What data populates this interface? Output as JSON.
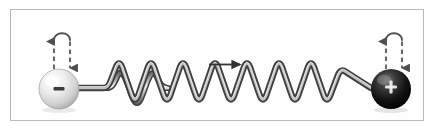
{
  "figure": {
    "title": "Oscillating dipole: two opposite charges joined by a spring",
    "background_color": "#ffffff",
    "frame": {
      "border_color": "#b9b9b9",
      "fill_color": "#fefefe",
      "x": 10,
      "y": 9,
      "width": 414,
      "height": 112
    },
    "objects": {
      "left_charge": {
        "name": "negative-charge-sphere",
        "sign_label": "−",
        "sign_color": "#3a3a3a",
        "fill_light": "#ffffff",
        "fill_mid": "#e2e2e2",
        "fill_dark": "#a9a9a9",
        "center_x": 59,
        "center_y": 89,
        "radius": 20
      },
      "right_charge": {
        "name": "positive-charge-sphere",
        "sign_label": "+",
        "sign_color": "#f2f2f2",
        "fill_light": "#6e6e6e",
        "fill_mid": "#1c1c1c",
        "fill_dark": "#000000",
        "center_x": 391,
        "center_y": 89,
        "radius": 20
      },
      "spring": {
        "name": "coil-spring",
        "color_edge": "#4a4a4a",
        "color_core": "#d6d6d6",
        "coil_count": 5,
        "amplitude": 15,
        "baseline_y": 88,
        "start_x": 79,
        "end_x": 371
      },
      "left_oscillation_arrow": {
        "name": "oscillation-arrow-left",
        "style": "dashed double-headed U-turn",
        "color": "#4f4f4f",
        "top_y": 34,
        "bottom_y": 72,
        "x": 59
      },
      "right_oscillation_arrow": {
        "name": "oscillation-arrow-right",
        "style": "dashed double-headed U-turn",
        "color": "#4f4f4f",
        "top_y": 34,
        "bottom_y": 72,
        "x": 391
      },
      "motion_arrow": {
        "name": "direction-of-motion-arrow",
        "style": "solid straight arrow pointing right",
        "color": "#333333",
        "x_start": 209,
        "x_end": 243,
        "y": 65
      }
    }
  }
}
